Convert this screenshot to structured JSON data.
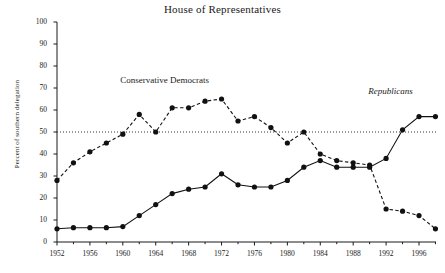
{
  "chart_data": {
    "type": "line",
    "title": "House of Representatives",
    "xlabel": "",
    "ylabel": "Percent of southern delegation",
    "xlim": [
      1952,
      1998
    ],
    "ylim": [
      0,
      100
    ],
    "yticks": [
      0,
      10,
      20,
      30,
      40,
      50,
      60,
      70,
      80,
      90,
      100
    ],
    "xticks": [
      1952,
      1956,
      1960,
      1964,
      1968,
      1972,
      1976,
      1980,
      1984,
      1988,
      1992,
      1996
    ],
    "grid": false,
    "legend_position": "inline-annotation",
    "reference_line": {
      "value": 50,
      "style": "dotted",
      "label": ""
    },
    "x": [
      1952,
      1954,
      1956,
      1958,
      1960,
      1962,
      1964,
      1966,
      1968,
      1970,
      1972,
      1974,
      1976,
      1978,
      1980,
      1982,
      1984,
      1986,
      1988,
      1990,
      1992,
      1994,
      1996,
      1998
    ],
    "series": [
      {
        "name": "Conservative Democrats",
        "style": "dashed",
        "marker": "circle",
        "color": "#111111",
        "values": [
          28,
          36,
          41,
          45,
          49,
          58,
          50,
          61,
          61,
          64,
          65,
          55,
          57,
          52,
          45,
          50,
          40,
          37,
          36,
          35,
          15,
          14,
          12,
          6
        ]
      },
      {
        "name": "Republicans",
        "style": "solid",
        "marker": "circle",
        "color": "#111111",
        "values": [
          6,
          6.5,
          6.5,
          6.5,
          7,
          12,
          17,
          22,
          24,
          25,
          31,
          26,
          25,
          25,
          28,
          34,
          37,
          34,
          34,
          34,
          38,
          51,
          57,
          57
        ]
      }
    ],
    "annotations": [
      {
        "text": "Conservative Democrats",
        "x": 1966,
        "y": 73,
        "style": "normal"
      },
      {
        "text": "Republicans",
        "x": 1993,
        "y": 68,
        "style": "italic"
      }
    ]
  },
  "caption": ""
}
